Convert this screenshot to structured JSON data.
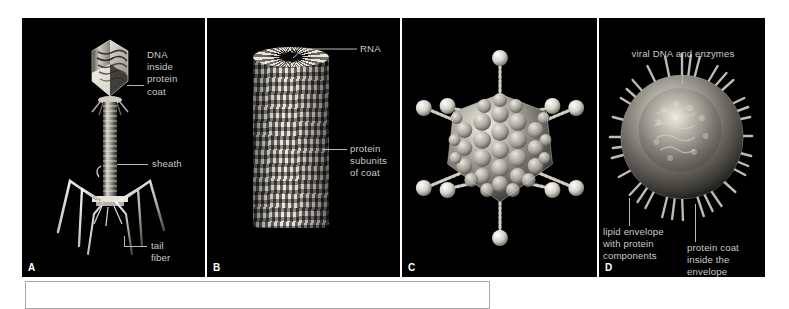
{
  "figure": {
    "background_color": "#000000",
    "page_background": "#ffffff",
    "label_color": "#c9c9c9",
    "leader_color": "#b9b9b9",
    "panels": [
      {
        "letter": "A",
        "subject": "bacteriophage",
        "labels": [
          {
            "name": "dna-inside-protein-coat",
            "text": "DNA\ninside\nprotein\ncoat"
          },
          {
            "name": "sheath",
            "text": "sheath"
          },
          {
            "name": "tail-fiber",
            "text": "tail\nfiber"
          }
        ]
      },
      {
        "letter": "B",
        "subject": "helical-virus",
        "labels": [
          {
            "name": "rna",
            "text": "RNA"
          },
          {
            "name": "protein-subunits-of-coat",
            "text": "protein\nsubunits\nof coat"
          }
        ]
      },
      {
        "letter": "C",
        "subject": "icosahedral-adenovirus",
        "labels": []
      },
      {
        "letter": "D",
        "subject": "enveloped-virus",
        "labels": [
          {
            "name": "viral-dna-and-enzymes",
            "text": "viral DNA and enzymes"
          },
          {
            "name": "lipid-envelope-with-protein-components",
            "text": "lipid envelope\nwith protein\ncomponents"
          },
          {
            "name": "protein-coat-inside-the-envelope",
            "text": "protein coat\ninside the\nenvelope"
          }
        ]
      }
    ]
  },
  "bottom_box": {
    "name": "caption-box",
    "text": ""
  }
}
